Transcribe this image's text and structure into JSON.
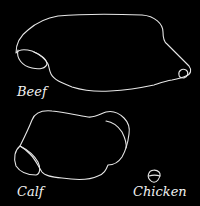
{
  "figure": {
    "background_color": "#000000",
    "stroke_color": "#e6e6e6",
    "label_color": "#f2f2f2",
    "specimens": [
      {
        "id": "beef",
        "label": "Beef"
      },
      {
        "id": "calf",
        "label": "Calf"
      },
      {
        "id": "chicken",
        "label": "Chicken"
      }
    ]
  }
}
